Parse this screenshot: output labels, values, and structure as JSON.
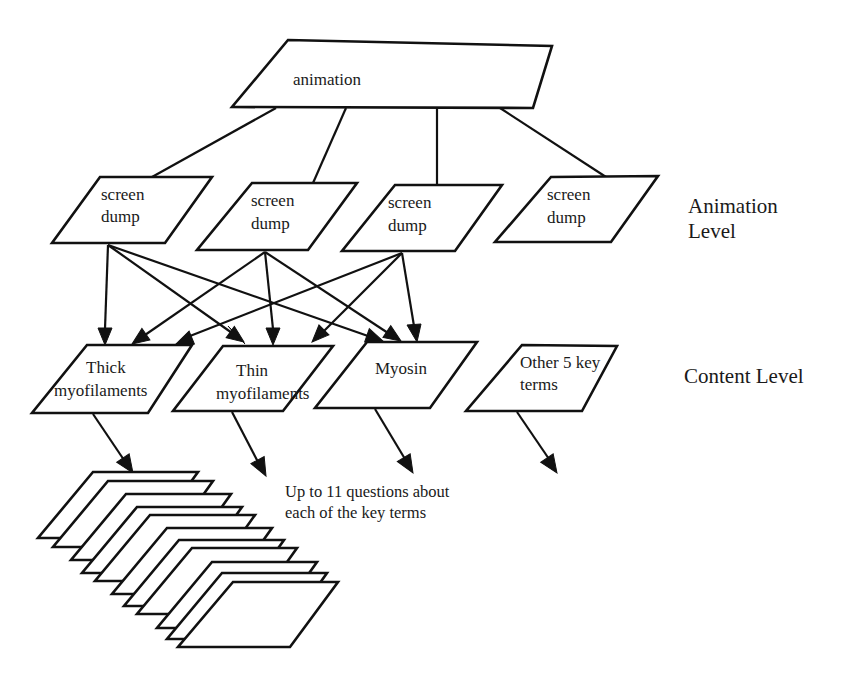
{
  "diagram": {
    "root": {
      "label": "animation"
    },
    "animation_level": {
      "title_line1": "Animation",
      "title_line2": "Level",
      "nodes": [
        {
          "line1": "screen",
          "line2": "dump"
        },
        {
          "line1": "screen",
          "line2": "dump"
        },
        {
          "line1": "screen",
          "line2": "dump"
        },
        {
          "line1": "screen",
          "line2": "dump"
        }
      ]
    },
    "content_level": {
      "title": "Content Level",
      "nodes": [
        {
          "line1": "Thick",
          "line2": "myofilaments"
        },
        {
          "line1": "Thin",
          "line2": "myofilaments"
        },
        {
          "line1": "Myosin",
          "line2": ""
        },
        {
          "line1": "Other 5 key",
          "line2": "terms"
        }
      ]
    },
    "questions_note": {
      "line1": "Up to 11 questions about",
      "line2": "each of the key terms"
    },
    "question_cards_count": 11,
    "edges": [
      {
        "from": "animation",
        "to": "screen dump 1"
      },
      {
        "from": "animation",
        "to": "screen dump 2"
      },
      {
        "from": "animation",
        "to": "screen dump 3"
      },
      {
        "from": "animation",
        "to": "screen dump 4"
      },
      {
        "from": "screen dump 1",
        "to": "Thick myofilaments",
        "arrow": true
      },
      {
        "from": "screen dump 1",
        "to": "Thin myofilaments",
        "arrow": true
      },
      {
        "from": "screen dump 1",
        "to": "Myosin",
        "arrow": true
      },
      {
        "from": "screen dump 2",
        "to": "Thick myofilaments",
        "arrow": true
      },
      {
        "from": "screen dump 2",
        "to": "Thin myofilaments",
        "arrow": true
      },
      {
        "from": "screen dump 2",
        "to": "Myosin",
        "arrow": true
      },
      {
        "from": "screen dump 3",
        "to": "Thick myofilaments",
        "arrow": true
      },
      {
        "from": "screen dump 3",
        "to": "Thin myofilaments",
        "arrow": true
      },
      {
        "from": "screen dump 3",
        "to": "Myosin",
        "arrow": true
      },
      {
        "from": "Thick myofilaments",
        "to": "questions",
        "arrow": true
      },
      {
        "from": "Thin myofilaments",
        "to": "questions",
        "arrow": true
      },
      {
        "from": "Myosin",
        "to": "questions",
        "arrow": true
      },
      {
        "from": "Other 5 key terms",
        "to": "questions",
        "arrow": true
      }
    ]
  }
}
